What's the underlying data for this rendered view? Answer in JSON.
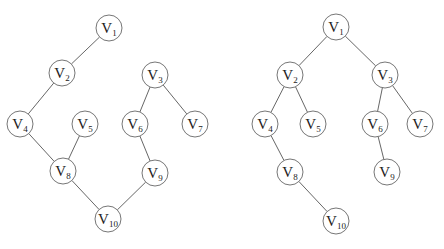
{
  "graphs": [
    {
      "name": "graph",
      "radius": 13,
      "nodes": [
        {
          "id": "V1",
          "base": "V",
          "sub": "1",
          "x": 109,
          "y": 28
        },
        {
          "id": "V2",
          "base": "V",
          "sub": "2",
          "x": 62,
          "y": 73
        },
        {
          "id": "V3",
          "base": "V",
          "sub": "3",
          "x": 155,
          "y": 75
        },
        {
          "id": "V4",
          "base": "V",
          "sub": "4",
          "x": 20,
          "y": 124
        },
        {
          "id": "V5",
          "base": "V",
          "sub": "5",
          "x": 85,
          "y": 124
        },
        {
          "id": "V6",
          "base": "V",
          "sub": "6",
          "x": 135,
          "y": 124
        },
        {
          "id": "V7",
          "base": "V",
          "sub": "7",
          "x": 195,
          "y": 124
        },
        {
          "id": "V8",
          "base": "V",
          "sub": "8",
          "x": 63,
          "y": 171
        },
        {
          "id": "V9",
          "base": "V",
          "sub": "9",
          "x": 155,
          "y": 173
        },
        {
          "id": "V10",
          "base": "V",
          "sub": "10",
          "x": 108,
          "y": 219
        }
      ],
      "edges": [
        [
          "V1",
          "V2"
        ],
        [
          "V2",
          "V4"
        ],
        [
          "V3",
          "V6"
        ],
        [
          "V3",
          "V7"
        ],
        [
          "V4",
          "V8"
        ],
        [
          "V5",
          "V8"
        ],
        [
          "V6",
          "V9"
        ],
        [
          "V8",
          "V10"
        ],
        [
          "V9",
          "V10"
        ]
      ]
    },
    {
      "name": "spanning-tree",
      "radius": 13,
      "nodes": [
        {
          "id": "V1",
          "base": "V",
          "sub": "1",
          "x": 336,
          "y": 27
        },
        {
          "id": "V2",
          "base": "V",
          "sub": "2",
          "x": 290,
          "y": 75
        },
        {
          "id": "V3",
          "base": "V",
          "sub": "3",
          "x": 385,
          "y": 75
        },
        {
          "id": "V4",
          "base": "V",
          "sub": "4",
          "x": 265,
          "y": 124
        },
        {
          "id": "V5",
          "base": "V",
          "sub": "5",
          "x": 313,
          "y": 124
        },
        {
          "id": "V6",
          "base": "V",
          "sub": "6",
          "x": 375,
          "y": 124
        },
        {
          "id": "V7",
          "base": "V",
          "sub": "7",
          "x": 420,
          "y": 124
        },
        {
          "id": "V8",
          "base": "V",
          "sub": "8",
          "x": 290,
          "y": 172
        },
        {
          "id": "V9",
          "base": "V",
          "sub": "9",
          "x": 387,
          "y": 172
        },
        {
          "id": "V10",
          "base": "V",
          "sub": "10",
          "x": 336,
          "y": 221
        }
      ],
      "edges": [
        [
          "V1",
          "V2"
        ],
        [
          "V1",
          "V3"
        ],
        [
          "V2",
          "V4"
        ],
        [
          "V2",
          "V5"
        ],
        [
          "V3",
          "V6"
        ],
        [
          "V3",
          "V7"
        ],
        [
          "V4",
          "V8"
        ],
        [
          "V6",
          "V9"
        ],
        [
          "V8",
          "V10"
        ]
      ]
    }
  ]
}
